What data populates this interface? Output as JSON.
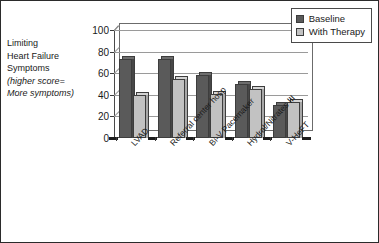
{
  "chart_data": {
    "type": "bar",
    "title": "",
    "xlabel": "",
    "ylabel": "Limiting Heart Failure Symptoms (higher score= More symptoms)",
    "ylim": [
      0,
      100
    ],
    "yticks": [
      0,
      20,
      40,
      60,
      80,
      100
    ],
    "grid": true,
    "legend_position": "top-right",
    "categories": [
      "LVAD",
      "Referral center hosp",
      "Bi-V Pacemaker",
      "Hydral/Nitrates III",
      "V-HeFT"
    ],
    "series": [
      {
        "name": "Baseline",
        "color": "#5a5a5a",
        "values": [
          73,
          73,
          58,
          50,
          31
        ]
      },
      {
        "name": "With Therapy",
        "color": "#c2c2c2",
        "values": [
          40,
          55,
          41,
          45,
          33
        ]
      }
    ]
  },
  "axis_title": {
    "line1": "Limiting",
    "line2": "Heart Failure",
    "line3": "Symptoms",
    "line4": "(higher score=",
    "line5": "More symptoms)"
  },
  "ytick_labels": {
    "t0": "0",
    "t1": "20",
    "t2": "40",
    "t3": "60",
    "t4": "80",
    "t5": "100"
  },
  "legend": {
    "item0": "Baseline",
    "item1": "With Therapy"
  },
  "categories": {
    "c0": "LVAD",
    "c1": "Referral center hosp",
    "c2": "Bi-V Pacemaker",
    "c3": "Hydral/Nitrates III",
    "c4": "V-HeFT"
  },
  "colors": {
    "baseline": "#5a5a5a",
    "therapy": "#c2c2c2",
    "axis": "#3a3a3a",
    "grid": "#9a9a9a",
    "border": "#2b2b2b"
  }
}
